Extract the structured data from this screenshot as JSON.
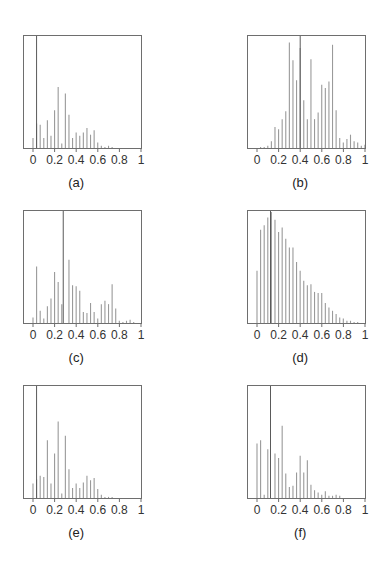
{
  "chart_data": [
    {
      "id": "a",
      "caption": "(a)",
      "type": "bar",
      "xlim": [
        -0.1,
        1
      ],
      "ylim": [
        0,
        1
      ],
      "xticks": [
        "0",
        "0.2",
        "0.4",
        "0.6",
        "0.8",
        "1"
      ],
      "grid": false,
      "legend": false,
      "x_step": 0.0333,
      "values": [
        0.09,
        0.22,
        0.21,
        0.09,
        0.25,
        0.11,
        0.34,
        0.55,
        0.04,
        0.49,
        0.3,
        0.09,
        0.14,
        0.11,
        0.14,
        0.18,
        0.12,
        0.16,
        0.05,
        0.02,
        0.01,
        0.02,
        0.01,
        0,
        0,
        0,
        0,
        0,
        0,
        0,
        0
      ],
      "marker_x": 0.033
    },
    {
      "id": "b",
      "caption": "(b)",
      "type": "bar",
      "xlim": [
        -0.1,
        1
      ],
      "ylim": [
        0,
        1
      ],
      "xticks": [
        "0",
        "0.2",
        "0.4",
        "0.6",
        "0.8",
        "1"
      ],
      "grid": false,
      "legend": false,
      "x_step": 0.0333,
      "values": [
        0.0,
        0.01,
        0.01,
        0.02,
        0.06,
        0.19,
        0.17,
        0.26,
        0.33,
        0.95,
        0.79,
        0.61,
        0.9,
        0.43,
        0.26,
        0.8,
        0.26,
        0.32,
        0.57,
        0.54,
        0.6,
        0.93,
        0.34,
        0.09,
        0.05,
        0.08,
        0.12,
        0.06,
        0.05,
        0.02,
        0.03
      ],
      "marker_x": 0.4
    },
    {
      "id": "c",
      "caption": "(c)",
      "type": "bar",
      "xlim": [
        -0.1,
        1
      ],
      "ylim": [
        0,
        1
      ],
      "xticks": [
        "0",
        "0.2",
        "0.4",
        "0.6",
        "0.8",
        "1"
      ],
      "grid": false,
      "legend": false,
      "x_step": 0.0333,
      "values": [
        0.05,
        0.51,
        0.11,
        0.04,
        0.15,
        0.22,
        0.46,
        0.37,
        0.17,
        0.0,
        0.57,
        0.34,
        0.33,
        0.29,
        0.1,
        0.09,
        0.18,
        0.1,
        0.04,
        0.17,
        0.2,
        0.17,
        0.35,
        0.13,
        0.02,
        0.01,
        0.02,
        0.03,
        0.01,
        0.0,
        0.0
      ],
      "marker_x": 0.28
    },
    {
      "id": "d",
      "caption": "(d)",
      "type": "bar",
      "xlim": [
        -0.1,
        1
      ],
      "ylim": [
        0,
        1
      ],
      "xticks": [
        "0",
        "0.2",
        "0.4",
        "0.6",
        "0.8",
        "1"
      ],
      "grid": false,
      "legend": false,
      "x_step": 0.0333,
      "values": [
        0.47,
        0.84,
        0.88,
        0.95,
        1.0,
        0.93,
        0.82,
        0.86,
        0.76,
        0.68,
        0.68,
        0.55,
        0.47,
        0.38,
        0.34,
        0.35,
        0.28,
        0.27,
        0.27,
        0.18,
        0.14,
        0.11,
        0.08,
        0.05,
        0.04,
        0.02,
        0.02,
        0.01,
        0.01,
        0.0,
        0.0
      ],
      "marker_x": 0.125
    },
    {
      "id": "e",
      "caption": "(e)",
      "type": "bar",
      "xlim": [
        -0.1,
        1
      ],
      "ylim": [
        0,
        1
      ],
      "xticks": [
        "0",
        "0.2",
        "0.4",
        "0.6",
        "0.8",
        "1"
      ],
      "grid": false,
      "legend": false,
      "x_step": 0.0333,
      "values": [
        0.13,
        0.17,
        0.2,
        0.19,
        0.52,
        0.13,
        0.4,
        0.69,
        0.04,
        0.56,
        0.26,
        0.09,
        0.13,
        0.09,
        0.14,
        0.2,
        0.16,
        0.18,
        0.08,
        0.03,
        0.01,
        0.01,
        0.01,
        0,
        0,
        0,
        0,
        0,
        0,
        0,
        0
      ],
      "marker_x": 0.033
    },
    {
      "id": "f",
      "caption": "(f)",
      "type": "bar",
      "xlim": [
        -0.1,
        1
      ],
      "ylim": [
        0,
        1
      ],
      "xticks": [
        "0",
        "0.2",
        "0.4",
        "0.6",
        "0.8",
        "1"
      ],
      "grid": false,
      "legend": false,
      "x_step": 0.0333,
      "values": [
        0.49,
        0.52,
        0.03,
        0.44,
        0.0,
        0.4,
        0.36,
        0.65,
        0.22,
        0.1,
        0.11,
        0.23,
        0.38,
        0.23,
        0.34,
        0.12,
        0.07,
        0.05,
        0.03,
        0.06,
        0.02,
        0.02,
        0.03,
        0.02,
        0.0,
        0.0,
        0.0,
        0.0,
        0.0,
        0.0,
        0.0
      ],
      "marker_x": 0.125
    }
  ],
  "colors": {
    "bar": "#9a9a9a",
    "frame": "#6e6e6e",
    "marker": "#5a5a5a",
    "text": "#333333"
  }
}
